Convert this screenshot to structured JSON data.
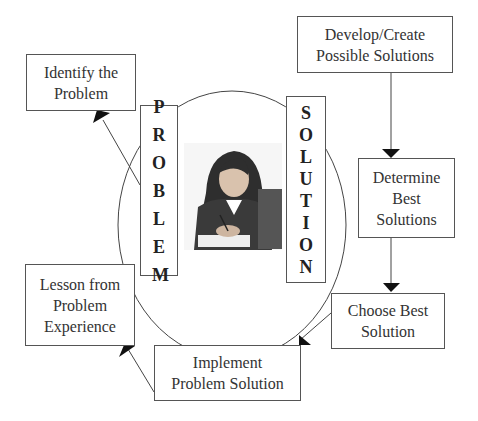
{
  "diagram": {
    "center": {
      "left_label": "PROBLEM",
      "right_label": "SOLUTION",
      "image": "woman-writing-at-desk-photo"
    },
    "steps": [
      {
        "id": "identify",
        "label": "Identify the\nProblem"
      },
      {
        "id": "develop",
        "label": "Develop/Create\nPossible Solutions"
      },
      {
        "id": "determine",
        "label": "Determine\nBest\nSolutions"
      },
      {
        "id": "choose",
        "label": "Choose Best\nSolution"
      },
      {
        "id": "implement",
        "label": "Implement\nProblem Solution"
      },
      {
        "id": "lesson",
        "label": "Lesson from\nProblem\nExperience"
      }
    ],
    "connections": [
      {
        "from": "PROBLEM",
        "to": "identify"
      },
      {
        "from": "develop",
        "to": "determine"
      },
      {
        "from": "determine",
        "to": "choose"
      },
      {
        "from": "choose",
        "to": "implement"
      },
      {
        "from": "implement",
        "to": "lesson"
      }
    ]
  }
}
